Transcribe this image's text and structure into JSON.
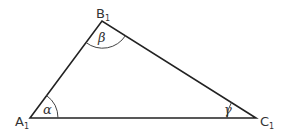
{
  "diagram": {
    "type": "triangle",
    "stroke_color": "#222222",
    "vertices": {
      "A": {
        "label": "A",
        "subscript": "1"
      },
      "B": {
        "label": "B",
        "subscript": "1"
      },
      "C": {
        "label": "C",
        "subscript": "1"
      }
    },
    "angles": {
      "alpha": "α",
      "beta": "β",
      "gamma": "γ"
    }
  }
}
